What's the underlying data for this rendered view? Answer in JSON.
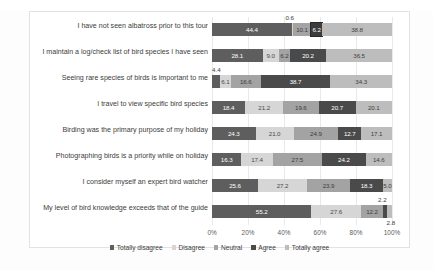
{
  "top_text": "",
  "chart_data": {
    "type": "bar",
    "subtype": "stacked-horizontal-100",
    "title": "",
    "xlabel": "",
    "ylabel": "",
    "xlim": [
      0,
      100
    ],
    "grid": true,
    "legend_position": "bottom",
    "xticks": [
      "0%",
      "20%",
      "40%",
      "60%",
      "80%",
      "100%"
    ],
    "xtick_values": [
      0,
      20,
      40,
      60,
      80,
      100
    ],
    "legend": [
      "Totally disagree",
      "Disagree",
      "Neutral",
      "Agree",
      "Totally agree"
    ],
    "colors": [
      "#5e5e5e",
      "#d6d6d6",
      "#a3a3a3",
      "#4a4a4a",
      "#bdbdbd"
    ],
    "categories": [
      "I have not seen albatross prior to this tour",
      "I maintain a log/check list of bird species I have seen",
      "Seeing rare species of birds is important to me",
      "I travel to view specific bird species",
      "Birding was the primary purpose of my holiday",
      "Photographing birds is a priority while on holiday",
      "I consider myself an expert bird watcher",
      "My level of bird knowledge exceeds that of the guide"
    ],
    "series": [
      {
        "name": "Totally disagree",
        "values": [
          44.4,
          28.1,
          4.4,
          18.4,
          24.3,
          16.3,
          25.6,
          55.2
        ]
      },
      {
        "name": "Disagree",
        "values": [
          0.6,
          9.0,
          6.1,
          21.2,
          21.0,
          17.4,
          27.2,
          27.6
        ]
      },
      {
        "name": "Neutral",
        "values": [
          10.1,
          6.2,
          16.6,
          19.6,
          24.9,
          27.5,
          23.9,
          12.2
        ]
      },
      {
        "name": "Agree",
        "values": [
          6.2,
          20.2,
          38.7,
          20.7,
          12.7,
          24.2,
          18.3,
          2.2
        ]
      },
      {
        "name": "Totally agree",
        "values": [
          38.8,
          36.5,
          34.3,
          20.1,
          17.1,
          14.6,
          5.0,
          2.8
        ]
      }
    ],
    "rows": [
      {
        "label": "I have not seen albatross prior to this tour",
        "segments": [
          {
            "value": "44.4",
            "pct": 44.4,
            "style": "s0",
            "inside": true
          },
          {
            "value": "0.6",
            "pct": 0.6,
            "style": "s1",
            "inside": false,
            "callout": "above"
          },
          {
            "value": "10.1",
            "pct": 10.1,
            "style": "s2",
            "inside": true
          },
          {
            "value": "6.2",
            "pct": 6.2,
            "style": "s3",
            "inside": true,
            "boxed": true
          },
          {
            "value": "38.8",
            "pct": 38.8,
            "style": "s4",
            "inside": true
          }
        ]
      },
      {
        "label": "I maintain a log/check list of bird species I have seen",
        "segments": [
          {
            "value": "28.1",
            "pct": 28.1,
            "style": "s0",
            "inside": true
          },
          {
            "value": "9.0",
            "pct": 9.0,
            "style": "s1",
            "inside": true
          },
          {
            "value": "6.2",
            "pct": 6.2,
            "style": "s2",
            "inside": true
          },
          {
            "value": "20.2",
            "pct": 20.2,
            "style": "s3",
            "inside": true
          },
          {
            "value": "36.5",
            "pct": 36.5,
            "style": "s4",
            "inside": true
          }
        ]
      },
      {
        "label": "Seeing rare species of birds is important to me",
        "segments": [
          {
            "value": "4.4",
            "pct": 4.4,
            "style": "s0",
            "inside": false,
            "callout": "above"
          },
          {
            "value": "6.1",
            "pct": 6.1,
            "style": "s1",
            "inside": true
          },
          {
            "value": "16.6",
            "pct": 16.6,
            "style": "s2",
            "inside": true
          },
          {
            "value": "38.7",
            "pct": 38.7,
            "style": "s3",
            "inside": true
          },
          {
            "value": "34.3",
            "pct": 34.3,
            "style": "s4",
            "inside": true
          }
        ]
      },
      {
        "label": "I travel to view specific bird species",
        "segments": [
          {
            "value": "18.4",
            "pct": 18.4,
            "style": "s0",
            "inside": true
          },
          {
            "value": "21.2",
            "pct": 21.2,
            "style": "s1",
            "inside": true
          },
          {
            "value": "19.6",
            "pct": 19.6,
            "style": "s2",
            "inside": true
          },
          {
            "value": "20.7",
            "pct": 20.7,
            "style": "s3",
            "inside": true
          },
          {
            "value": "20.1",
            "pct": 20.1,
            "style": "s4",
            "inside": true
          }
        ]
      },
      {
        "label": "Birding was the primary purpose of my holiday",
        "segments": [
          {
            "value": "24.3",
            "pct": 24.3,
            "style": "s0",
            "inside": true
          },
          {
            "value": "21.0",
            "pct": 21.0,
            "style": "s1",
            "inside": true
          },
          {
            "value": "24.9",
            "pct": 24.9,
            "style": "s2",
            "inside": true
          },
          {
            "value": "12.7",
            "pct": 12.7,
            "style": "s3",
            "inside": true
          },
          {
            "value": "17.1",
            "pct": 17.1,
            "style": "s4",
            "inside": true
          }
        ]
      },
      {
        "label": "Photographing birds is a priority while on holiday",
        "segments": [
          {
            "value": "16.3",
            "pct": 16.3,
            "style": "s0",
            "inside": true
          },
          {
            "value": "17.4",
            "pct": 17.4,
            "style": "s1",
            "inside": true
          },
          {
            "value": "27.5",
            "pct": 27.5,
            "style": "s2",
            "inside": true
          },
          {
            "value": "24.2",
            "pct": 24.2,
            "style": "s3",
            "inside": true
          },
          {
            "value": "14.6",
            "pct": 14.6,
            "style": "s4",
            "inside": true
          }
        ]
      },
      {
        "label": "I consider myself an expert bird watcher",
        "segments": [
          {
            "value": "25.6",
            "pct": 25.6,
            "style": "s0",
            "inside": true
          },
          {
            "value": "27.2",
            "pct": 27.2,
            "style": "s1",
            "inside": true
          },
          {
            "value": "23.9",
            "pct": 23.9,
            "style": "s2",
            "inside": true
          },
          {
            "value": "18.3",
            "pct": 18.3,
            "style": "s3",
            "inside": true
          },
          {
            "value": "5.0",
            "pct": 5.0,
            "style": "s4",
            "inside": true
          }
        ]
      },
      {
        "label": "My level of bird knowledge exceeds that of the guide",
        "segments": [
          {
            "value": "55.2",
            "pct": 55.2,
            "style": "s0",
            "inside": true
          },
          {
            "value": "27.6",
            "pct": 27.6,
            "style": "s1",
            "inside": true
          },
          {
            "value": "12.2",
            "pct": 12.2,
            "style": "s2",
            "inside": true
          },
          {
            "value": "2.2",
            "pct": 2.2,
            "style": "s3",
            "inside": false,
            "callout": "above"
          },
          {
            "value": "2.8",
            "pct": 2.8,
            "style": "s4",
            "inside": false,
            "callout": "below"
          }
        ]
      }
    ]
  }
}
